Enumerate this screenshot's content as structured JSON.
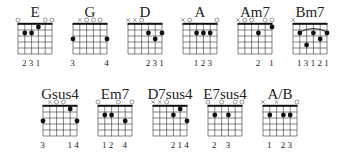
{
  "diagram": {
    "strings": 6,
    "frets_shown": 5,
    "colors": {
      "line": "#333333",
      "dot": "#111111",
      "nut": "#111111"
    },
    "chords": [
      {
        "name": "E",
        "row": 0,
        "x": 18,
        "open": [
          1,
          0,
          0,
          0,
          1,
          1
        ],
        "muted": [
          0,
          0,
          0,
          0,
          0,
          0
        ],
        "dots": [
          [
            2,
            2
          ],
          [
            3,
            2
          ],
          [
            4,
            1
          ]
        ],
        "barre": null,
        "fingers": [
          "",
          "2",
          "3",
          "1",
          "",
          ""
        ]
      },
      {
        "name": "G",
        "row": 0,
        "x": 73,
        "open": [
          0,
          0,
          1,
          1,
          1,
          0
        ],
        "muted": [
          0,
          1,
          0,
          0,
          0,
          0
        ],
        "dots": [
          [
            1,
            3
          ],
          [
            6,
            3
          ]
        ],
        "barre": null,
        "fingers": [
          "3",
          "",
          "",
          "",
          "",
          "4"
        ]
      },
      {
        "name": "D",
        "row": 0,
        "x": 128,
        "open": [
          0,
          0,
          1,
          0,
          0,
          0
        ],
        "muted": [
          1,
          1,
          0,
          0,
          0,
          0
        ],
        "dots": [
          [
            4,
            2
          ],
          [
            5,
            3
          ],
          [
            6,
            2
          ]
        ],
        "barre": null,
        "fingers": [
          "",
          "",
          "",
          "2",
          "3",
          "1"
        ]
      },
      {
        "name": "A",
        "row": 0,
        "x": 183,
        "open": [
          0,
          1,
          0,
          0,
          0,
          1
        ],
        "muted": [
          1,
          0,
          0,
          0,
          0,
          0
        ],
        "dots": [
          [
            3,
            2
          ],
          [
            4,
            2
          ],
          [
            5,
            2
          ]
        ],
        "barre": null,
        "fingers": [
          "",
          "",
          "1",
          "2",
          "3",
          ""
        ]
      },
      {
        "name": "Am7",
        "row": 0,
        "x": 238,
        "open": [
          0,
          1,
          1,
          0,
          1,
          1
        ],
        "muted": [
          1,
          0,
          0,
          0,
          0,
          0
        ],
        "dots": [
          [
            4,
            2
          ],
          [
            6,
            1
          ]
        ],
        "barre": null,
        "fingers": [
          "",
          "",
          "",
          "2",
          "",
          "1"
        ]
      },
      {
        "name": "Bm7",
        "row": 0,
        "x": 293,
        "open": [
          0,
          0,
          0,
          0,
          0,
          0
        ],
        "muted": [
          1,
          0,
          0,
          0,
          0,
          0
        ],
        "dots": [
          [
            2,
            2
          ],
          [
            3,
            4
          ],
          [
            4,
            2
          ],
          [
            5,
            3
          ],
          [
            6,
            2
          ]
        ],
        "barre": [
          2,
          6,
          2
        ],
        "fingers": [
          "",
          "1",
          "3",
          "1",
          "2",
          "1"
        ]
      },
      {
        "name": "Gsus4",
        "row": 1,
        "x": 43,
        "open": [
          0,
          0,
          1,
          1,
          0,
          0
        ],
        "muted": [
          0,
          1,
          0,
          0,
          0,
          0
        ],
        "dots": [
          [
            1,
            3
          ],
          [
            5,
            1
          ],
          [
            6,
            3
          ]
        ],
        "barre": null,
        "fingers": [
          "3",
          "",
          "",
          "",
          "1",
          "4"
        ]
      },
      {
        "name": "Em7",
        "row": 1,
        "x": 98,
        "open": [
          1,
          0,
          0,
          1,
          0,
          1
        ],
        "muted": [
          0,
          0,
          0,
          0,
          0,
          0
        ],
        "dots": [
          [
            2,
            2
          ],
          [
            3,
            2
          ],
          [
            5,
            3
          ]
        ],
        "barre": null,
        "fingers": [
          "",
          "1",
          "2",
          "",
          "4",
          ""
        ]
      },
      {
        "name": "D7sus4",
        "row": 1,
        "x": 153,
        "open": [
          0,
          0,
          1,
          0,
          0,
          0
        ],
        "muted": [
          1,
          1,
          0,
          0,
          0,
          0
        ],
        "dots": [
          [
            4,
            2
          ],
          [
            5,
            1
          ],
          [
            6,
            3
          ]
        ],
        "barre": null,
        "fingers": [
          "",
          "",
          "",
          "2",
          "1",
          "4"
        ]
      },
      {
        "name": "E7sus4",
        "row": 1,
        "x": 208,
        "open": [
          1,
          0,
          1,
          0,
          1,
          1
        ],
        "muted": [
          0,
          0,
          0,
          0,
          0,
          0
        ],
        "dots": [
          [
            2,
            2
          ],
          [
            4,
            2
          ]
        ],
        "barre": null,
        "fingers": [
          "",
          "2",
          "",
          "3",
          "",
          ""
        ]
      },
      {
        "name": "A/B",
        "row": 1,
        "x": 263,
        "open": [
          0,
          0,
          0,
          0,
          0,
          1
        ],
        "muted": [
          1,
          0,
          1,
          0,
          0,
          0
        ],
        "dots": [
          [
            2,
            2
          ],
          [
            4,
            2
          ],
          [
            5,
            2
          ]
        ],
        "barre": null,
        "fingers": [
          "",
          "1",
          "",
          "2",
          "3",
          ""
        ]
      }
    ]
  }
}
